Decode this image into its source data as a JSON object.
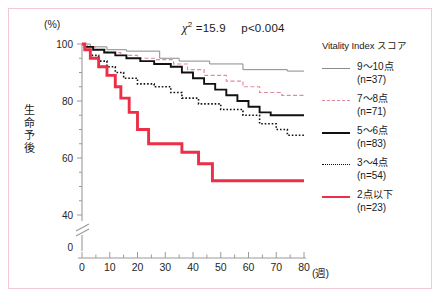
{
  "figure": {
    "unit_y": "(%)",
    "unit_x": "(週)",
    "ylabel_chars": [
      "生",
      "命",
      "予",
      "後"
    ],
    "stat_chi_symbol": "χ",
    "stat_chi_sup": "2",
    "stat_chi_value": "=15.9",
    "stat_p_value": "p<0.004",
    "caption": ""
  },
  "legend": {
    "title": "Vitality Index スコア",
    "items": [
      {
        "label": "9～10点",
        "n": "(n=37)",
        "style": "thin-gray",
        "color": "#8a8a8a"
      },
      {
        "label": "7～8点",
        "n": "(n=71)",
        "style": "pink-dashed",
        "color": "#e08a9c"
      },
      {
        "label": "5～6点",
        "n": "(n=83)",
        "style": "black-solid",
        "color": "#111111"
      },
      {
        "label": "3～4点",
        "n": "(n=54)",
        "style": "black-dotted",
        "color": "#111111"
      },
      {
        "label": "2点以下",
        "n": "(n=23)",
        "style": "red-thick",
        "color": "#ec2f46"
      }
    ]
  },
  "chart_data": {
    "type": "line",
    "title": "",
    "subtitle": "",
    "xlabel": "(週)",
    "ylabel": "生命予後 (%)",
    "xlim": [
      0,
      80
    ],
    "ylim": [
      40,
      100
    ],
    "y_axis_break": true,
    "y_break_below": 40,
    "y_zero_shown": 0,
    "grid": false,
    "legend_position": "right",
    "xticks": [
      0,
      10,
      20,
      30,
      40,
      50,
      60,
      70,
      80
    ],
    "xminor_step": 5,
    "yticks": [
      40,
      60,
      80,
      100
    ],
    "yminor_step": 5,
    "annotations": [
      {
        "text": "χ2 =15.9",
        "x": 35,
        "y": 103
      },
      {
        "text": "p<0.004",
        "x": 52,
        "y": 103
      }
    ],
    "series": [
      {
        "name": "9～10点",
        "n": 37,
        "color": "#8a8a8a",
        "style": "thin-gray",
        "points": [
          [
            0,
            100
          ],
          [
            3,
            100
          ],
          [
            3,
            99
          ],
          [
            9,
            99
          ],
          [
            9,
            98
          ],
          [
            16,
            98
          ],
          [
            16,
            97.5
          ],
          [
            28,
            97.5
          ],
          [
            28,
            95
          ],
          [
            35,
            95
          ],
          [
            35,
            94
          ],
          [
            46,
            94
          ],
          [
            46,
            93
          ],
          [
            58,
            93
          ],
          [
            58,
            91
          ],
          [
            74,
            91
          ],
          [
            74,
            90.5
          ],
          [
            80,
            90.5
          ]
        ]
      },
      {
        "name": "7～8点",
        "n": 71,
        "color": "#e08a9c",
        "style": "pink-dashed",
        "points": [
          [
            0,
            100
          ],
          [
            2,
            100
          ],
          [
            2,
            99
          ],
          [
            5,
            99
          ],
          [
            5,
            98
          ],
          [
            9,
            98
          ],
          [
            9,
            97
          ],
          [
            14,
            97
          ],
          [
            14,
            96
          ],
          [
            20,
            96
          ],
          [
            20,
            95
          ],
          [
            26,
            95
          ],
          [
            26,
            94.5
          ],
          [
            33,
            94.5
          ],
          [
            33,
            93
          ],
          [
            38,
            93
          ],
          [
            38,
            91
          ],
          [
            44,
            91
          ],
          [
            44,
            89
          ],
          [
            52,
            89
          ],
          [
            52,
            87
          ],
          [
            58,
            87
          ],
          [
            58,
            85
          ],
          [
            64,
            85
          ],
          [
            64,
            83
          ],
          [
            72,
            83
          ],
          [
            72,
            82
          ],
          [
            80,
            82
          ]
        ]
      },
      {
        "name": "5～6点",
        "n": 83,
        "color": "#111111",
        "style": "black-solid",
        "points": [
          [
            0,
            100
          ],
          [
            1,
            100
          ],
          [
            1,
            99
          ],
          [
            4,
            99
          ],
          [
            4,
            98
          ],
          [
            8,
            98
          ],
          [
            8,
            97
          ],
          [
            12,
            97
          ],
          [
            12,
            96
          ],
          [
            16,
            96
          ],
          [
            16,
            95
          ],
          [
            21,
            95
          ],
          [
            21,
            94
          ],
          [
            26,
            94
          ],
          [
            26,
            93
          ],
          [
            32,
            93
          ],
          [
            32,
            92
          ],
          [
            36,
            92
          ],
          [
            36,
            90
          ],
          [
            40,
            90
          ],
          [
            40,
            88
          ],
          [
            44,
            88
          ],
          [
            44,
            86
          ],
          [
            48,
            86
          ],
          [
            48,
            84
          ],
          [
            52,
            84
          ],
          [
            52,
            82
          ],
          [
            56,
            82
          ],
          [
            56,
            80
          ],
          [
            60,
            80
          ],
          [
            60,
            78
          ],
          [
            64,
            78
          ],
          [
            64,
            76
          ],
          [
            68,
            76
          ],
          [
            68,
            75
          ],
          [
            80,
            75
          ]
        ]
      },
      {
        "name": "3～4点",
        "n": 54,
        "color": "#111111",
        "style": "black-dotted",
        "points": [
          [
            0,
            100
          ],
          [
            1,
            100
          ],
          [
            1,
            98
          ],
          [
            3,
            98
          ],
          [
            3,
            96
          ],
          [
            6,
            96
          ],
          [
            6,
            94
          ],
          [
            9,
            94
          ],
          [
            9,
            92
          ],
          [
            12,
            92
          ],
          [
            12,
            90
          ],
          [
            15,
            90
          ],
          [
            15,
            88
          ],
          [
            20,
            88
          ],
          [
            20,
            86
          ],
          [
            26,
            86
          ],
          [
            26,
            85
          ],
          [
            32,
            85
          ],
          [
            32,
            83
          ],
          [
            36,
            83
          ],
          [
            36,
            81
          ],
          [
            42,
            81
          ],
          [
            42,
            79
          ],
          [
            50,
            79
          ],
          [
            50,
            77
          ],
          [
            58,
            77
          ],
          [
            58,
            75
          ],
          [
            64,
            75
          ],
          [
            64,
            72
          ],
          [
            70,
            72
          ],
          [
            70,
            70
          ],
          [
            74,
            70
          ],
          [
            74,
            68
          ],
          [
            80,
            68
          ]
        ]
      },
      {
        "name": "2点以下",
        "n": 23,
        "color": "#ec2f46",
        "style": "red-thick",
        "points": [
          [
            0,
            100
          ],
          [
            1,
            100
          ],
          [
            1,
            98
          ],
          [
            3,
            98
          ],
          [
            3,
            95
          ],
          [
            6,
            95
          ],
          [
            6,
            92
          ],
          [
            9,
            92
          ],
          [
            9,
            89
          ],
          [
            12,
            89
          ],
          [
            12,
            85
          ],
          [
            14,
            85
          ],
          [
            14,
            81
          ],
          [
            17,
            81
          ],
          [
            17,
            76
          ],
          [
            20,
            76
          ],
          [
            20,
            70
          ],
          [
            24,
            70
          ],
          [
            24,
            65
          ],
          [
            36,
            65
          ],
          [
            36,
            62
          ],
          [
            42,
            62
          ],
          [
            42,
            58
          ],
          [
            47,
            58
          ],
          [
            47,
            52
          ],
          [
            80,
            52
          ]
        ]
      }
    ]
  }
}
